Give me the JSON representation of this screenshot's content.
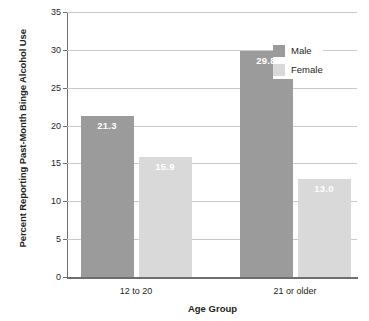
{
  "chart_data": {
    "type": "bar",
    "title": "",
    "xlabel": "Age Group",
    "ylabel": "Percent Reporting Past-Month Binge Alcohol Use",
    "categories": [
      "12 to 20",
      "21 or older"
    ],
    "series": [
      {
        "name": "Male",
        "values": [
          21.3,
          29.8
        ],
        "color": "#9b9b9b"
      },
      {
        "name": "Female",
        "values": [
          15.9,
          13.0
        ],
        "color": "#d9d9d9"
      }
    ],
    "value_labels": [
      [
        "21.3",
        "15.9"
      ],
      [
        "29.8",
        "13.0"
      ]
    ],
    "ylim": [
      0,
      35
    ],
    "yticks": [
      "0",
      "5",
      "10",
      "15",
      "20",
      "25",
      "30",
      "35"
    ],
    "ytick_values": [
      0,
      5,
      10,
      15,
      20,
      25,
      30,
      35
    ],
    "grid": true,
    "legend_position": "top-right",
    "legend": [
      "Male",
      "Female"
    ],
    "background": "#ffffff",
    "grid_color": "#c9c9c9",
    "axis_color": "#6d6e70",
    "label_text_color": "#ffffff"
  }
}
